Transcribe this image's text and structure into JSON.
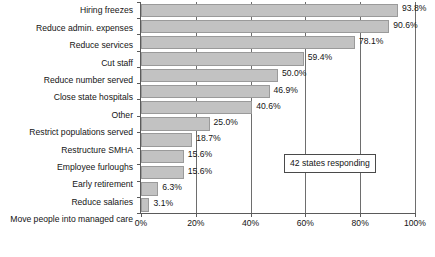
{
  "chart_data": {
    "type": "bar",
    "orientation": "horizontal",
    "title": "",
    "subtitle": "",
    "xlabel": "",
    "ylabel": "",
    "xlim": [
      0,
      100
    ],
    "xticks": [
      0,
      20,
      40,
      60,
      80,
      100
    ],
    "xtick_labels": [
      "0%",
      "20%",
      "40%",
      "60%",
      "80%",
      "100%"
    ],
    "grid": true,
    "grid_axis": "x",
    "legend": false,
    "legend_position": "none",
    "bar_color": "#c2c2c2",
    "bar_border_color": "#9a9a9a",
    "axis_color": "#5a5a5a",
    "categories": [
      "Hiring freezes",
      "Reduce admin. expenses",
      "Reduce services",
      "Cut staff",
      "Reduce number served",
      "Close state hospitals",
      "Other",
      "Restrict populations served",
      "Restructure SMHA",
      "Employee furloughs",
      "Early retirement",
      "Reduce salaries",
      "Move people into managed care"
    ],
    "values": [
      93.8,
      90.6,
      78.1,
      59.4,
      50.0,
      46.9,
      40.6,
      25.0,
      18.7,
      15.6,
      15.6,
      6.3,
      3.1
    ],
    "data_labels": [
      "93.8%",
      "90.6%",
      "78.1%",
      "59.4%",
      "50.0%",
      "46.9%",
      "40.6%",
      "25.0%",
      "18.7%",
      "15.6%",
      "15.6%",
      "6.3%",
      "3.1%"
    ],
    "annotations": [
      {
        "text": "42 states responding",
        "x_percent": 52.2,
        "y_category_index": 8.8
      }
    ]
  }
}
